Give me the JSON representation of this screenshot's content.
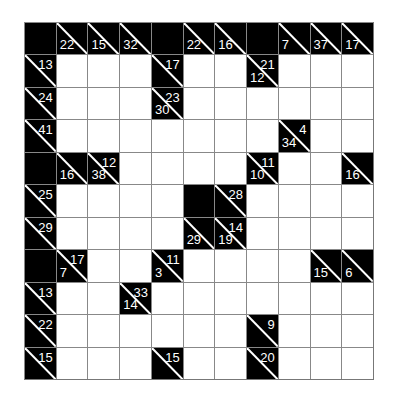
{
  "puzzle": {
    "type": "kakuro",
    "rows": 11,
    "cols": 11,
    "grid": [
      [
        {
          "t": "B"
        },
        {
          "t": "C",
          "d": "22"
        },
        {
          "t": "C",
          "d": "15"
        },
        {
          "t": "C",
          "d": "32"
        },
        {
          "t": "B"
        },
        {
          "t": "C",
          "d": "22"
        },
        {
          "t": "C",
          "d": "16"
        },
        {
          "t": "B"
        },
        {
          "t": "C",
          "d": "7"
        },
        {
          "t": "C",
          "d": "37"
        },
        {
          "t": "C",
          "d": "17"
        }
      ],
      [
        {
          "t": "C",
          "a": "13"
        },
        {
          "t": "W"
        },
        {
          "t": "W"
        },
        {
          "t": "W"
        },
        {
          "t": "C",
          "a": "17"
        },
        {
          "t": "W"
        },
        {
          "t": "W"
        },
        {
          "t": "C",
          "a": "21",
          "d": "12"
        },
        {
          "t": "W"
        },
        {
          "t": "W"
        },
        {
          "t": "W"
        }
      ],
      [
        {
          "t": "C",
          "a": "24"
        },
        {
          "t": "W"
        },
        {
          "t": "W"
        },
        {
          "t": "W"
        },
        {
          "t": "C",
          "a": "23",
          "d": "30"
        },
        {
          "t": "W"
        },
        {
          "t": "W"
        },
        {
          "t": "W"
        },
        {
          "t": "W"
        },
        {
          "t": "W"
        },
        {
          "t": "W"
        }
      ],
      [
        {
          "t": "C",
          "a": "41"
        },
        {
          "t": "W"
        },
        {
          "t": "W"
        },
        {
          "t": "W"
        },
        {
          "t": "W"
        },
        {
          "t": "W"
        },
        {
          "t": "W"
        },
        {
          "t": "W"
        },
        {
          "t": "C",
          "a": "4",
          "d": "34"
        },
        {
          "t": "W"
        },
        {
          "t": "W"
        }
      ],
      [
        {
          "t": "B"
        },
        {
          "t": "C",
          "d": "16"
        },
        {
          "t": "C",
          "a": "12",
          "d": "38"
        },
        {
          "t": "W"
        },
        {
          "t": "W"
        },
        {
          "t": "W"
        },
        {
          "t": "W"
        },
        {
          "t": "C",
          "a": "11",
          "d": "10"
        },
        {
          "t": "W"
        },
        {
          "t": "W"
        },
        {
          "t": "C",
          "d": "16"
        }
      ],
      [
        {
          "t": "C",
          "a": "25"
        },
        {
          "t": "W"
        },
        {
          "t": "W"
        },
        {
          "t": "W"
        },
        {
          "t": "W"
        },
        {
          "t": "B"
        },
        {
          "t": "C",
          "a": "28"
        },
        {
          "t": "W"
        },
        {
          "t": "W"
        },
        {
          "t": "W"
        },
        {
          "t": "W"
        }
      ],
      [
        {
          "t": "C",
          "a": "29"
        },
        {
          "t": "W"
        },
        {
          "t": "W"
        },
        {
          "t": "W"
        },
        {
          "t": "W"
        },
        {
          "t": "C",
          "d": "29"
        },
        {
          "t": "C",
          "a": "14",
          "d": "19"
        },
        {
          "t": "W"
        },
        {
          "t": "W"
        },
        {
          "t": "W"
        },
        {
          "t": "W"
        }
      ],
      [
        {
          "t": "B"
        },
        {
          "t": "C",
          "a": "17",
          "d": "7"
        },
        {
          "t": "W"
        },
        {
          "t": "W"
        },
        {
          "t": "C",
          "a": "11",
          "d": "3"
        },
        {
          "t": "W"
        },
        {
          "t": "W"
        },
        {
          "t": "W"
        },
        {
          "t": "W"
        },
        {
          "t": "C",
          "d": "15"
        },
        {
          "t": "C",
          "d": "6"
        }
      ],
      [
        {
          "t": "C",
          "a": "13"
        },
        {
          "t": "W"
        },
        {
          "t": "W"
        },
        {
          "t": "C",
          "a": "33",
          "d": "14"
        },
        {
          "t": "W"
        },
        {
          "t": "W"
        },
        {
          "t": "W"
        },
        {
          "t": "W"
        },
        {
          "t": "W"
        },
        {
          "t": "W"
        },
        {
          "t": "W"
        }
      ],
      [
        {
          "t": "C",
          "a": "22"
        },
        {
          "t": "W"
        },
        {
          "t": "W"
        },
        {
          "t": "W"
        },
        {
          "t": "W"
        },
        {
          "t": "W"
        },
        {
          "t": "W"
        },
        {
          "t": "C",
          "a": "9"
        },
        {
          "t": "W"
        },
        {
          "t": "W"
        },
        {
          "t": "W"
        }
      ],
      [
        {
          "t": "C",
          "a": "15"
        },
        {
          "t": "W"
        },
        {
          "t": "W"
        },
        {
          "t": "W"
        },
        {
          "t": "C",
          "a": "15"
        },
        {
          "t": "W"
        },
        {
          "t": "W"
        },
        {
          "t": "C",
          "a": "20"
        },
        {
          "t": "W"
        },
        {
          "t": "W"
        },
        {
          "t": "W"
        }
      ]
    ]
  }
}
